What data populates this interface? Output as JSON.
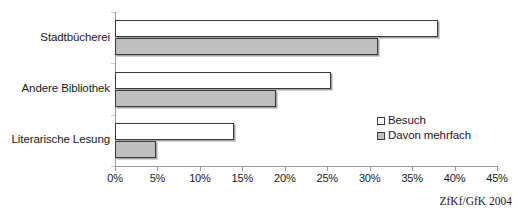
{
  "chart_data": {
    "type": "bar",
    "orientation": "horizontal",
    "title": "",
    "subtitle": "",
    "xlabel": "",
    "ylabel": "",
    "categories": [
      "Stadtbücherei",
      "Andere Bibliothek",
      "Literarische Lesung"
    ],
    "series": [
      {
        "name": "Besuch",
        "values": [
          38,
          25.5,
          14
        ],
        "color": "#ffffff"
      },
      {
        "name": "Davon mehrfach",
        "values": [
          31,
          19,
          4.8
        ],
        "color": "#bfbfbf"
      }
    ],
    "xlim": [
      0,
      45
    ],
    "xtick_values": [
      0,
      5,
      10,
      15,
      20,
      25,
      30,
      35,
      40,
      45
    ],
    "xtick_labels": [
      "0%",
      "5%",
      "10%",
      "15%",
      "20%",
      "25%",
      "30%",
      "35%",
      "40%",
      "45%"
    ],
    "grid": false,
    "legend_position": "inside-right",
    "annotations": [
      "ZfKf/GfK 2004"
    ]
  },
  "legend": {
    "entries": [
      {
        "label": "Besuch"
      },
      {
        "label": "Davon mehrfach"
      }
    ]
  },
  "source": {
    "text": "ZfKf/GfK 2004"
  }
}
